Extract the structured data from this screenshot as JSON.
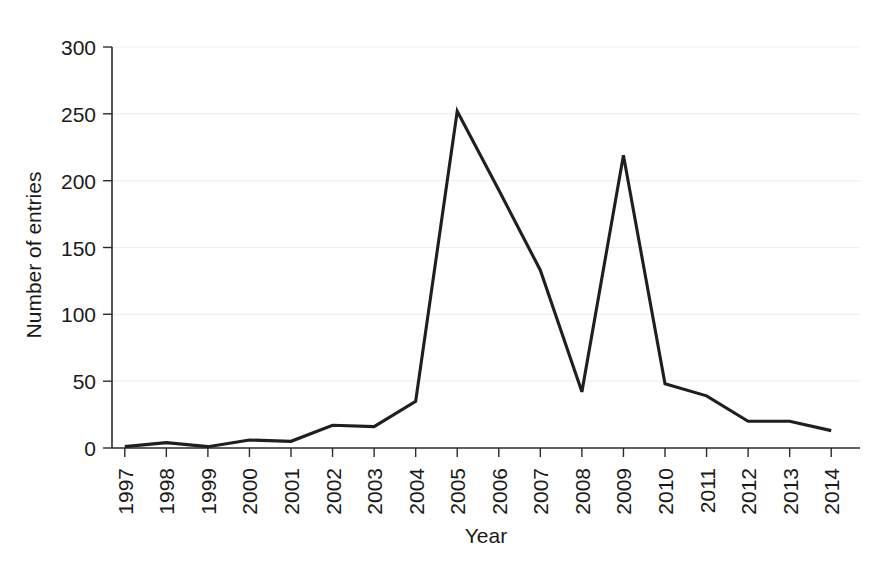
{
  "chart_data": {
    "type": "line",
    "title": "",
    "xlabel": "Year",
    "ylabel": "Number of entries",
    "categories": [
      "1997",
      "1998",
      "1999",
      "2000",
      "2001",
      "2002",
      "2003",
      "2004",
      "2005",
      "2006",
      "2007",
      "2008",
      "2009",
      "2010",
      "2011",
      "2012",
      "2013",
      "2014"
    ],
    "values": [
      1,
      4,
      1,
      6,
      5,
      17,
      16,
      35,
      252,
      193,
      133,
      42,
      219,
      48,
      39,
      20,
      20,
      13
    ],
    "series": [
      {
        "name": "Number of entries",
        "values": [
          1,
          4,
          1,
          6,
          5,
          17,
          16,
          35,
          252,
          193,
          133,
          42,
          219,
          48,
          39,
          20,
          20,
          13
        ]
      }
    ],
    "x": [
      "1997",
      "1998",
      "1999",
      "2000",
      "2001",
      "2002",
      "2003",
      "2004",
      "2005",
      "2006",
      "2007",
      "2008",
      "2009",
      "2010",
      "2011",
      "2012",
      "2013",
      "2014"
    ],
    "ylim": [
      0,
      300
    ],
    "yticks": [
      0,
      50,
      100,
      150,
      200,
      250,
      300
    ],
    "ytick_labels": [
      "0",
      "50",
      "100",
      "150",
      "200",
      "250",
      "300"
    ],
    "xtick_labels": [
      "1997",
      "1998",
      "1999",
      "2000",
      "2001",
      "2002",
      "2003",
      "2004",
      "2005",
      "2006",
      "2007",
      "2008",
      "2009",
      "2010",
      "2011",
      "2012",
      "2013",
      "2014"
    ],
    "grid": true,
    "grid_axis": "y",
    "legend": "none",
    "line_color": "#1f1f1f",
    "grid_color": "#eceff3",
    "axis_color": "#2b2b2b",
    "background_color": "#ffffff",
    "xtick_label_rotation": 90
  },
  "axes": {
    "y_title": "Number of entries",
    "x_title": "Year",
    "y_tick_0": "0",
    "y_tick_1": "50",
    "y_tick_2": "100",
    "y_tick_3": "150",
    "y_tick_4": "200",
    "y_tick_5": "250",
    "y_tick_6": "300"
  }
}
